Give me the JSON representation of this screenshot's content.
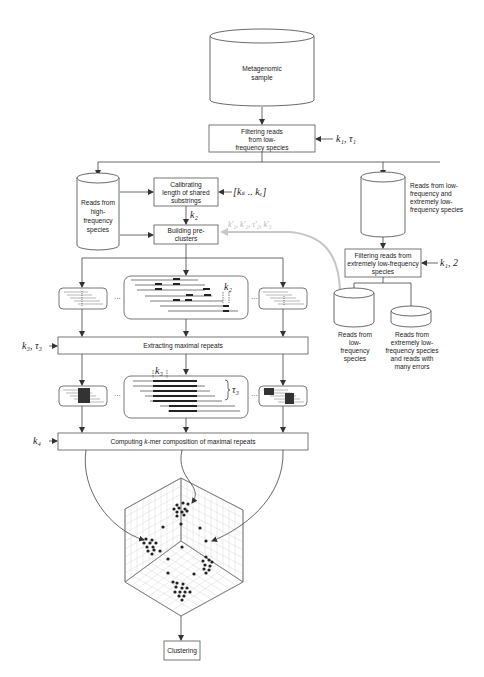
{
  "diagram": {
    "nodes": {
      "sample": {
        "label_l1": "Metagenomic",
        "label_l2": "sample",
        "shape": "cylinder"
      },
      "filter_low": {
        "l1": "Filtering reads",
        "l2": "from low-",
        "l3": "frequency species",
        "shape": "box"
      },
      "high_freq_reads": {
        "l1": "Reads from",
        "l2": "high-",
        "l3": "frequency",
        "l4": "species",
        "shape": "cylinder"
      },
      "calibrating": {
        "l1": "Calibrating",
        "l2": "length of shared",
        "l3": "substrings",
        "shape": "box"
      },
      "building": {
        "l1": "Building pre-",
        "l2": "clusters",
        "shape": "box"
      },
      "low_and_ext_reads": {
        "l1": "Reads from low-",
        "l2": "frequency and",
        "l3": "extremely low-",
        "l4": "frequency species",
        "shape": "cylinder"
      },
      "filter_ext": {
        "l1": "Filtering reads from",
        "l2": "extremely low-frequency",
        "l3": "species",
        "shape": "box"
      },
      "low_reads": {
        "l1": "Reads from",
        "l2": "low-",
        "l3": "frequency",
        "l4": "species",
        "shape": "cylinder"
      },
      "ext_reads": {
        "l1": "Reads from",
        "l2": "extremely low-",
        "l3": "frequency species",
        "l4": "and reads with",
        "l5": "many errors",
        "shape": "cylinder-short"
      },
      "extracting": {
        "label": "Extracting maximal repeats",
        "shape": "box"
      },
      "computing": {
        "label_pre": "Computing ",
        "label_k": "k",
        "label_post": "-mer composition of maximal repeats",
        "shape": "box"
      },
      "clustering": {
        "label": "Clustering",
        "shape": "box"
      }
    },
    "params": {
      "k1_tau1": "k₁, τ₁",
      "k1_2": "k₁, 2",
      "k_range": "[kₛ .. kₑ]",
      "k2": "k₂",
      "k2_dash": "k₂",
      "feedback": "k′₁, k′₂, τ′₂, k′₃",
      "k3_tau3": "k₃, τ₃",
      "k3": "k₃",
      "tau3": "τ₃",
      "k4": "k₄"
    },
    "ellipsis": "···",
    "colors": {
      "stroke": "#444444",
      "feedback_arrow": "#c8c8c8",
      "grid": "#d0d0d0",
      "dots": "#222222"
    }
  }
}
